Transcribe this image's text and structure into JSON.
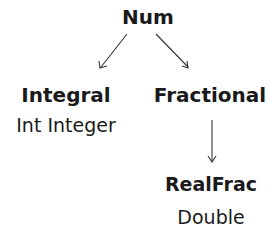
{
  "nodes": {
    "num": {
      "label": "Num"
    },
    "integral": {
      "label": "Integral",
      "members": "Int Integer"
    },
    "fractional": {
      "label": "Fractional"
    },
    "realfrac": {
      "label": "RealFrac",
      "members": "Double"
    }
  },
  "edges": [
    {
      "from": "Num",
      "to": "Integral"
    },
    {
      "from": "Num",
      "to": "Fractional"
    },
    {
      "from": "Fractional",
      "to": "RealFrac"
    }
  ]
}
